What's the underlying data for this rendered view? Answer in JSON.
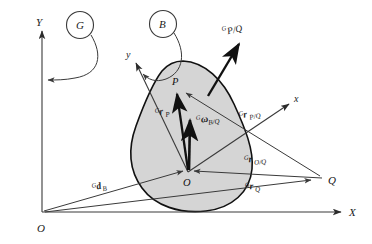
{
  "figure": {
    "type": "vector-kinematics-diagram",
    "background_color": "#ffffff",
    "line_color": "#3a3a3a",
    "body_fill": "#d5d5d5",
    "body_stroke": "#111111"
  },
  "global_frame": {
    "name": "G",
    "origin_label": "O",
    "y_axis_label": "Y",
    "x_axis_label": "X",
    "callout_label": "G"
  },
  "body": {
    "name": "B",
    "callout_label": "B",
    "origin_label": "O",
    "local_x_label": "x",
    "local_y_label": "y"
  },
  "points": {
    "p_label": "P",
    "q_label": "Q"
  },
  "vectors": [
    {
      "key": "p_over_q",
      "pre_superscript": "G",
      "symbol": "",
      "subscript": "P/Q",
      "full_label": "G P/Q"
    },
    {
      "key": "r_p",
      "pre_superscript": "G",
      "symbol": "r",
      "subscript": "P",
      "full_label": "G r P"
    },
    {
      "key": "omega_b_over_q",
      "pre_superscript": "G",
      "symbol": "ω",
      "subscript": "B/Q",
      "full_label": "G ω B/Q"
    },
    {
      "key": "r_p_over_q",
      "pre_superscript": "G",
      "symbol": "r",
      "subscript": "P/Q",
      "full_label": "G r P/Q"
    },
    {
      "key": "r_o_over_q",
      "pre_superscript": "G",
      "symbol": "r",
      "subscript": "O/Q",
      "full_label": "G r O/Q"
    },
    {
      "key": "r_q",
      "pre_superscript": "G",
      "symbol": "r",
      "subscript": "Q",
      "full_label": "G r Q"
    },
    {
      "key": "d_b",
      "pre_superscript": "G",
      "symbol": "d",
      "subscript": "B",
      "full_label": "G d B"
    }
  ]
}
